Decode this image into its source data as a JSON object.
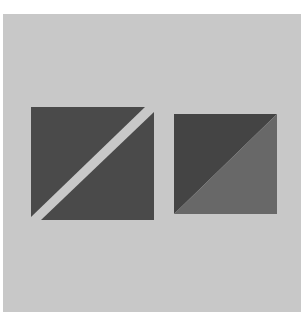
{
  "figure": {
    "colors": {
      "background": "#c8c8c8",
      "left_upper_triangle": "#4a4a4a",
      "left_lower_triangle": "#4a4a4a",
      "gap": "#c8c8c8",
      "right_upper_triangle": "#444444",
      "right_lower_triangle": "#686868"
    },
    "left_square": {
      "upper_triangle": "31,107 145,107 31,217",
      "lower_triangle": "154,112 154,220 41,220"
    },
    "right_square": {
      "upper_triangle": "174,114 277,114 174,214",
      "lower_triangle": "277,114 277,214 174,214"
    }
  }
}
